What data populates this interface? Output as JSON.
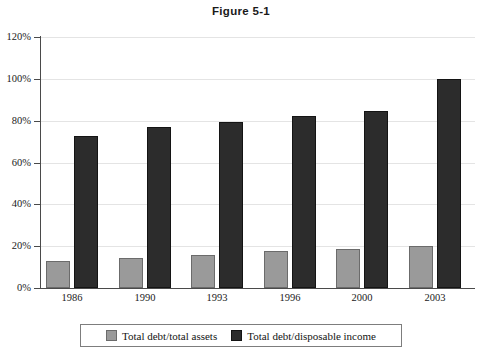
{
  "chart_data": {
    "type": "bar",
    "title": "Figure 5-1",
    "xlabel": "",
    "ylabel": "",
    "categories": [
      "1986",
      "1990",
      "1993",
      "1996",
      "2000",
      "2003"
    ],
    "series": [
      {
        "name": "Total debt/total assets",
        "color": "#9a9a9a",
        "values": [
          13,
          14.5,
          16,
          17.5,
          18.5,
          20
        ]
      },
      {
        "name": "Total debt/disposable income",
        "color": "#2c2c2c",
        "values": [
          72.5,
          77,
          79.5,
          82,
          84.5,
          100
        ]
      }
    ],
    "ylim": [
      0,
      120
    ],
    "ytick_values": [
      0,
      20,
      40,
      60,
      80,
      100,
      120
    ],
    "ytick_labels": [
      "0%",
      "20%",
      "40%",
      "60%",
      "80%",
      "100%",
      "120%"
    ],
    "grid": true,
    "legend_position": "bottom"
  },
  "legend": {
    "entries": [
      {
        "label": "Total debt/total assets"
      },
      {
        "label": "Total debt/disposable income"
      }
    ]
  }
}
